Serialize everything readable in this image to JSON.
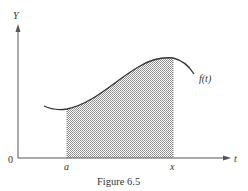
{
  "figure": {
    "caption": "Figure 6.5",
    "y_axis_label": "Y",
    "x_axis_label": "t",
    "origin_label": "0",
    "lower_limit_label": "a",
    "upper_limit_label": "x",
    "curve_label": "f(t)",
    "shaded_region": "area under f(t) from a to x",
    "colors": {
      "axis": "#555555",
      "curve": "#333333",
      "hatch": "#8a8a8a",
      "text": "#333333"
    }
  }
}
